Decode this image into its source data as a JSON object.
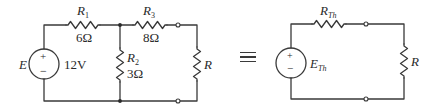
{
  "original_circuit": {
    "source": {
      "symbol": "E",
      "value": "12V",
      "plus": "+",
      "minus": "−"
    },
    "resistors": [
      {
        "id": "R1",
        "name": "R",
        "subscript": "1",
        "value": "6Ω",
        "position": "top-left series"
      },
      {
        "id": "R2",
        "name": "R",
        "subscript": "2",
        "value": "3Ω",
        "position": "shunt middle"
      },
      {
        "id": "R3",
        "name": "R",
        "subscript": "3",
        "value": "8Ω",
        "position": "top-right series"
      }
    ],
    "load": {
      "name": "R"
    }
  },
  "equivalence_symbol": "≡",
  "thevenin_circuit": {
    "source": {
      "name": "E",
      "subscript": "Th",
      "plus": "+",
      "minus": "−"
    },
    "resistor": {
      "name": "R",
      "subscript": "Th"
    },
    "load": {
      "name": "R"
    }
  },
  "colors": {
    "line": "#3a3a3a",
    "text": "#2a2a2a",
    "background": "#ffffff"
  }
}
